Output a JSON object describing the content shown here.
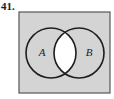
{
  "problem": {
    "number": "41."
  },
  "diagram": {
    "type": "venn",
    "universe": {
      "x": 19,
      "y": 12,
      "width": 91,
      "height": 81,
      "fill": "#d4d4d4",
      "stroke": "#555555"
    },
    "sets": [
      {
        "label": "A",
        "cx": 51,
        "cy": 53,
        "r": 25,
        "label_x": 42,
        "label_y": 56
      },
      {
        "label": "B",
        "cx": 79,
        "cy": 53,
        "r": 25,
        "label_x": 89,
        "label_y": 56
      }
    ],
    "shading": {
      "shaded_region": "complement of A ∩ B",
      "shaded_color": "#d4d4d4",
      "unshaded_region": "A ∩ B",
      "unshaded_color": "#ffffff"
    },
    "circle_stroke": "#1e1e1e"
  }
}
